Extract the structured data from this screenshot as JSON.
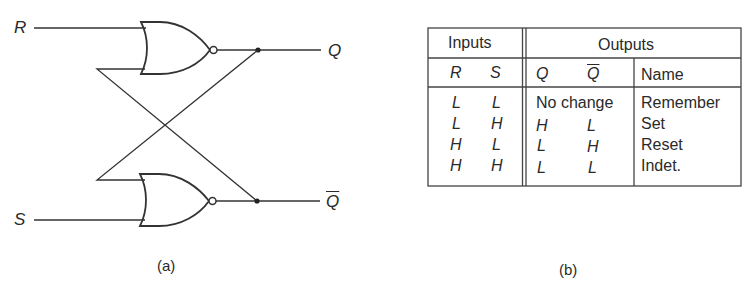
{
  "figure_a": {
    "caption": "(a)",
    "inputs": {
      "r_label": "R",
      "s_label": "S"
    },
    "outputs": {
      "q_label": "Q",
      "qbar_label": "Q"
    },
    "gates": [
      {
        "type": "NOR",
        "position": "top",
        "inputs": [
          "R",
          "Q-bar feedback"
        ],
        "output": "Q"
      },
      {
        "type": "NOR",
        "position": "bottom",
        "inputs": [
          "Q feedback",
          "S"
        ],
        "output": "Q-bar"
      }
    ],
    "line_color": "#333333"
  },
  "figure_b": {
    "caption": "(b)",
    "header": {
      "inputs": "Inputs",
      "outputs": "Outputs",
      "r": "R",
      "s": "S",
      "q": "Q",
      "qbar": "Q",
      "name": "Name"
    },
    "rows": [
      {
        "r": "L",
        "s": "L",
        "q": "No change",
        "qbar": "",
        "name": "Remember"
      },
      {
        "r": "L",
        "s": "H",
        "q": "H",
        "qbar": "L",
        "name": "Set"
      },
      {
        "r": "H",
        "s": "L",
        "q": "L",
        "qbar": "H",
        "name": "Reset"
      },
      {
        "r": "H",
        "s": "H",
        "q": "L",
        "qbar": "L",
        "name": "Indet."
      }
    ]
  }
}
